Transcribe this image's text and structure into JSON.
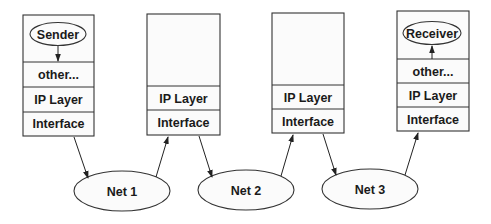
{
  "diagram": {
    "title": "",
    "hosts": [
      {
        "id": "sender",
        "app_label": "Sender",
        "layers": [
          "other...",
          "IP Layer",
          "Interface"
        ]
      },
      {
        "id": "router1",
        "app_label": "",
        "layers": [
          "IP Layer",
          "Interface"
        ]
      },
      {
        "id": "router2",
        "app_label": "",
        "layers": [
          "IP Layer",
          "Interface"
        ]
      },
      {
        "id": "receiver",
        "app_label": "Receiver",
        "layers": [
          "other...",
          "IP Layer",
          "Interface"
        ]
      }
    ],
    "networks": [
      {
        "id": "net1",
        "label": "Net 1"
      },
      {
        "id": "net2",
        "label": "Net 2"
      },
      {
        "id": "net3",
        "label": "Net 3"
      }
    ],
    "edges": [
      {
        "from": "sender.app",
        "to": "sender.other"
      },
      {
        "from": "sender.interface",
        "to": "net1"
      },
      {
        "from": "net1",
        "to": "router1.interface"
      },
      {
        "from": "router1.interface",
        "to": "net2"
      },
      {
        "from": "net2",
        "to": "router2.interface"
      },
      {
        "from": "router2.interface",
        "to": "net3"
      },
      {
        "from": "net3",
        "to": "receiver.interface"
      },
      {
        "from": "receiver.other",
        "to": "receiver.app"
      }
    ],
    "colors": {
      "stroke": "#333333",
      "fill": "#fbfbfb",
      "background": "#ffffff",
      "text": "#1a1a1a"
    }
  }
}
